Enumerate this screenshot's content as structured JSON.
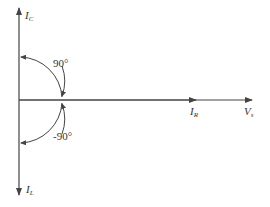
{
  "diagram": {
    "type": "phasor-diagram",
    "colors": {
      "line": "#444444",
      "text": "#333333",
      "background": "#ffffff"
    },
    "vectors": [
      {
        "id": "IC",
        "symbol": "I",
        "subscript": "C",
        "direction": "up"
      },
      {
        "id": "IL",
        "symbol": "I",
        "subscript": "L",
        "direction": "down"
      },
      {
        "id": "IR",
        "symbol": "I",
        "subscript": "R",
        "direction": "right"
      },
      {
        "id": "Vs",
        "symbol": "V",
        "subscript": "s",
        "direction": "right"
      }
    ],
    "angles": [
      {
        "label": "90°",
        "between": "IR-IC"
      },
      {
        "label": "-90°",
        "between": "IR-IL"
      }
    ]
  }
}
